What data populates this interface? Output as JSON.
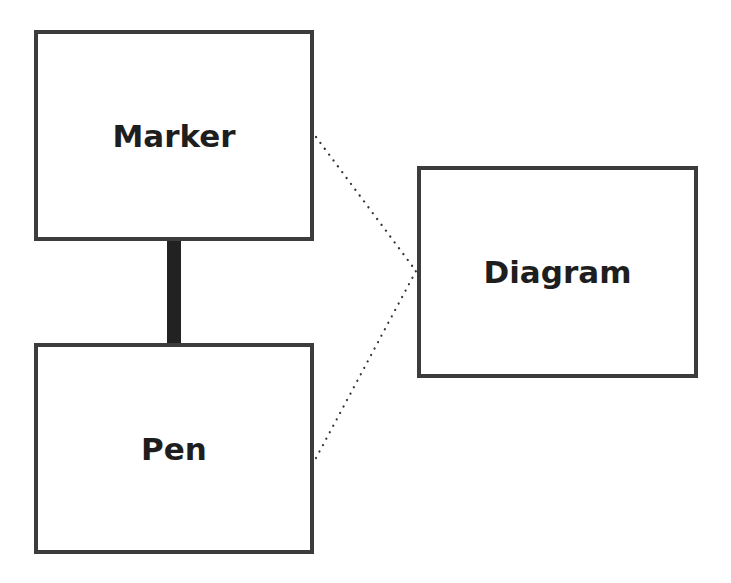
{
  "diagram": {
    "nodes": [
      {
        "id": "marker",
        "label": "Marker"
      },
      {
        "id": "pen",
        "label": "Pen"
      },
      {
        "id": "diagram",
        "label": "Diagram"
      }
    ],
    "edges": [
      {
        "from": "marker",
        "to": "pen",
        "style": "solid-thick"
      },
      {
        "from": "marker",
        "to": "diagram",
        "style": "dotted"
      },
      {
        "from": "pen",
        "to": "diagram",
        "style": "dotted"
      }
    ],
    "colors": {
      "border": "#3c3c3c",
      "text": "#1e1e1e",
      "solid_edge": "#222222",
      "dotted_edge": "#333333",
      "background": "#ffffff"
    }
  }
}
